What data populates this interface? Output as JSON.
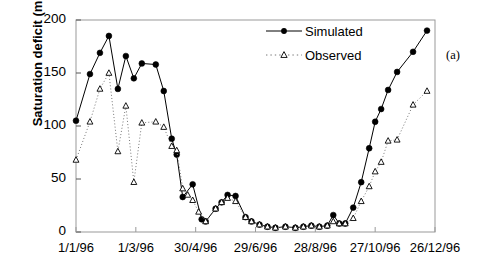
{
  "figure": {
    "panel_label": "(a)",
    "background": "#ffffff",
    "frame_color": "#999999"
  },
  "chart_data": {
    "type": "line",
    "title": "",
    "xlabel": "",
    "ylabel": "Saturation deficit (mm)",
    "ylim": [
      0,
      200
    ],
    "yticks": [
      0,
      50,
      100,
      150,
      200
    ],
    "ytick_labels": [
      "0",
      "50",
      "100",
      "150",
      "200"
    ],
    "xlim": [
      0,
      360
    ],
    "xticks": [
      0,
      60,
      120,
      180,
      240,
      300,
      360
    ],
    "xtick_labels": [
      "1/1/96",
      "1/3/96",
      "30/4/96",
      "29/6/96",
      "28/8/96",
      "27/10/96",
      "26/12/96"
    ],
    "grid": false,
    "legend_position": "top-right",
    "series": [
      {
        "name": "Simulated",
        "color": "#000000",
        "linestyle": "solid",
        "marker": "filled-circle",
        "points": [
          [
            0,
            105
          ],
          [
            14,
            149
          ],
          [
            24,
            169
          ],
          [
            33,
            185
          ],
          [
            42,
            135
          ],
          [
            50,
            166
          ],
          [
            58,
            145
          ],
          [
            66,
            159
          ],
          [
            80,
            158
          ],
          [
            88,
            133
          ],
          [
            96,
            88
          ],
          [
            101,
            73
          ],
          [
            107,
            33
          ],
          [
            117,
            45
          ],
          [
            126,
            12
          ],
          [
            130,
            10
          ],
          [
            140,
            22
          ],
          [
            146,
            28
          ],
          [
            152,
            35
          ],
          [
            160,
            34
          ],
          [
            170,
            14
          ],
          [
            176,
            10
          ],
          [
            184,
            7
          ],
          [
            192,
            5
          ],
          [
            200,
            4
          ],
          [
            210,
            5
          ],
          [
            220,
            4
          ],
          [
            228,
            5
          ],
          [
            236,
            6
          ],
          [
            244,
            5
          ],
          [
            252,
            6
          ],
          [
            258,
            16
          ],
          [
            264,
            8
          ],
          [
            270,
            8
          ],
          [
            278,
            23
          ],
          [
            286,
            47
          ],
          [
            294,
            79
          ],
          [
            300,
            104
          ],
          [
            306,
            116
          ],
          [
            313,
            134
          ],
          [
            322,
            151
          ],
          [
            338,
            170
          ],
          [
            352,
            190
          ]
        ]
      },
      {
        "name": "Observed",
        "color": "#000000",
        "linestyle": "dotted",
        "marker": "open-triangle",
        "points": [
          [
            0,
            68
          ],
          [
            14,
            104
          ],
          [
            24,
            135
          ],
          [
            33,
            150
          ],
          [
            42,
            76
          ],
          [
            50,
            119
          ],
          [
            58,
            47
          ],
          [
            66,
            103
          ],
          [
            80,
            104
          ],
          [
            88,
            99
          ],
          [
            96,
            81
          ],
          [
            101,
            77
          ],
          [
            107,
            41
          ],
          [
            112,
            35
          ],
          [
            117,
            30
          ],
          [
            123,
            19
          ],
          [
            130,
            10
          ],
          [
            140,
            22
          ],
          [
            146,
            28
          ],
          [
            152,
            32
          ],
          [
            160,
            29
          ],
          [
            170,
            14
          ],
          [
            176,
            10
          ],
          [
            184,
            7
          ],
          [
            192,
            5
          ],
          [
            200,
            4
          ],
          [
            210,
            5
          ],
          [
            220,
            4
          ],
          [
            228,
            5
          ],
          [
            236,
            6
          ],
          [
            244,
            5
          ],
          [
            252,
            6
          ],
          [
            258,
            10
          ],
          [
            264,
            8
          ],
          [
            270,
            8
          ],
          [
            278,
            13
          ],
          [
            286,
            29
          ],
          [
            294,
            43
          ],
          [
            300,
            57
          ],
          [
            306,
            66
          ],
          [
            313,
            86
          ],
          [
            322,
            87
          ],
          [
            338,
            120
          ],
          [
            352,
            133
          ]
        ]
      }
    ]
  },
  "legend": {
    "items": [
      {
        "label": "Simulated",
        "marker": "filled-circle",
        "linestyle": "solid"
      },
      {
        "label": "Observed",
        "marker": "open-triangle",
        "linestyle": "dotted"
      }
    ]
  }
}
